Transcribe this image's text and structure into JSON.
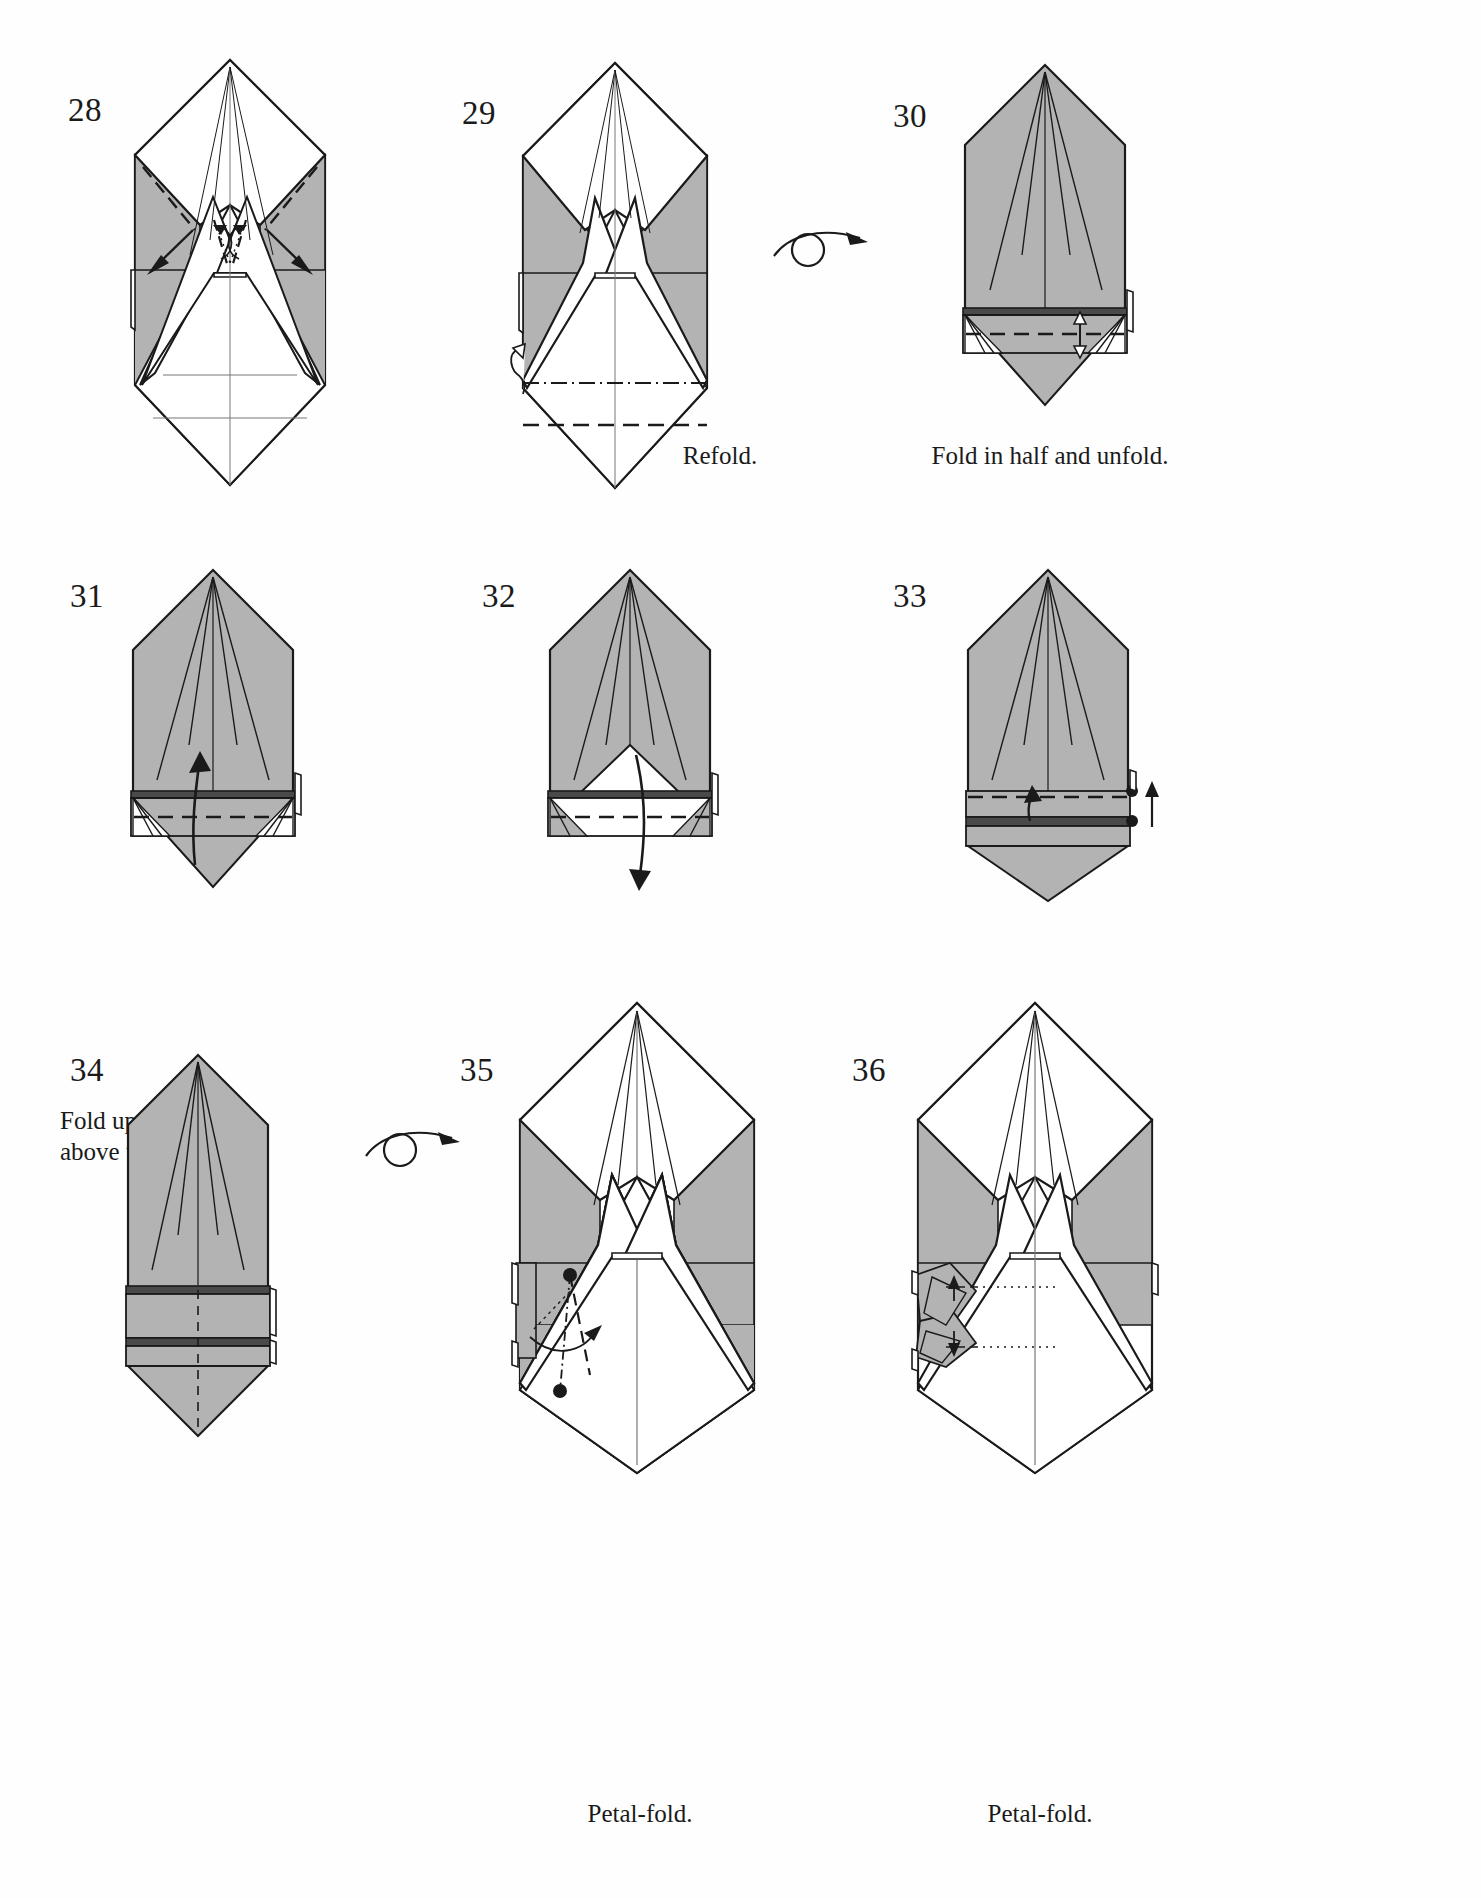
{
  "page": {
    "background_color": "#ffffff",
    "ink_color": "#1a1a1a",
    "shaded_paper_color": "#b0b0b0",
    "white_paper_color": "#ffffff"
  },
  "steps": [
    {
      "number": "28",
      "caption": "",
      "row": 1,
      "column": 1,
      "model_state": "white side up, pointed hood with two inner spikes, grey side flaps left and right",
      "symbols": [
        "valley-fold-dashed-line",
        "push-in-arrow-left",
        "push-in-arrow-right",
        "small-curl-arrow-pair"
      ]
    },
    {
      "number": "29",
      "caption": "Refold.",
      "row": 1,
      "column": 2,
      "model_state": "white front with two spikes, grey side panels, horizontal dash-dot crease and dashed valley crease near base",
      "symbols": [
        "dash-dot-mountain-crease",
        "dashed-valley-crease",
        "hidden-flap-outline"
      ]
    },
    {
      "number": "30",
      "caption": "Fold in half and unfold.",
      "row": 1,
      "column": 3,
      "model_state": "flipped over, grey side up, pentagon head with radiating creases, narrow band across bottom",
      "symbols": [
        "turn-over-arrow",
        "dashed-valley-crease",
        "double-headed-arrow-up-down"
      ]
    },
    {
      "number": "31",
      "caption": "Fold up slightly\nabove the crease.",
      "row": 2,
      "column": 1,
      "model_state": "grey pentagon body with horizontal band near base and white triangular wedges at band corners",
      "symbols": [
        "up-arrow",
        "dashed-valley-crease"
      ]
    },
    {
      "number": "32",
      "caption": "",
      "row": 2,
      "column": 2,
      "model_state": "grey pentagon body with white triangular peak revealed in band, dashed crease through band",
      "symbols": [
        "down-arrow",
        "dashed-valley-crease"
      ]
    },
    {
      "number": "33",
      "caption": "",
      "row": 2,
      "column": 3,
      "model_state": "grey body with narrow double band at base, two reference dots on right edge",
      "symbols": [
        "dashed-valley-crease",
        "short-up-arrow",
        "reference-dot-upper",
        "reference-dot-lower",
        "up-arrow-right"
      ]
    },
    {
      "number": "34",
      "caption": "",
      "row": 3,
      "column": 1,
      "model_state": "narrow grey body with two horizontal bands near the bottom and a pointed tail",
      "symbols": [
        "center-dashed-line"
      ]
    },
    {
      "number": "35",
      "caption": "Petal-fold.",
      "row": 3,
      "column": 2,
      "model_state": "flipped over, white front with two spikes and grey shoulders, petal-fold marked on left flap",
      "symbols": [
        "turn-over-arrow",
        "reference-dot-upper",
        "reference-dot-lower",
        "dash-dot-line",
        "dashed-valley-crease",
        "curved-fold-arrow"
      ]
    },
    {
      "number": "36",
      "caption": "Petal-fold.",
      "row": 3,
      "column": 3,
      "model_state": "white front with two spikes, grey shoulders, left flap petal-folded showing layered triangles",
      "symbols": [
        "dotted-reference-line-upper",
        "dotted-reference-line-lower",
        "small-double-arrow-up",
        "small-double-arrow-down"
      ]
    }
  ],
  "turn_over_symbols": [
    {
      "after_step": "29",
      "label": "turn-over-arrow"
    },
    {
      "after_step": "34",
      "label": "turn-over-arrow"
    }
  ]
}
